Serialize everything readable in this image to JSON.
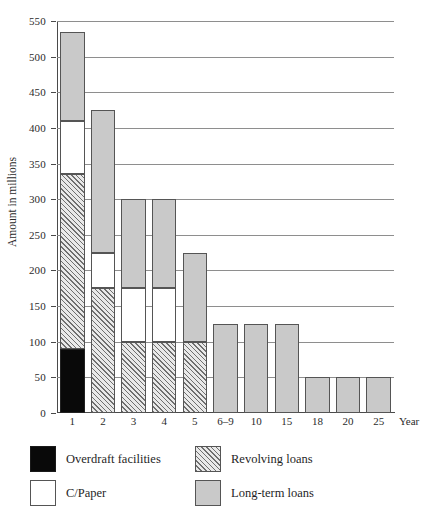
{
  "chart_data": {
    "type": "bar",
    "subtype": "stacked-vertical",
    "title": "",
    "xlabel": "Year",
    "ylabel": "Amount in millions",
    "categories": [
      "1",
      "2",
      "3",
      "4",
      "5",
      "6–9",
      "10",
      "15",
      "18",
      "20",
      "25"
    ],
    "series": [
      {
        "name": "Overdraft facilities",
        "color": "#090909",
        "pattern": "solid-black",
        "values": [
          90,
          0,
          0,
          0,
          0,
          0,
          0,
          0,
          0,
          0,
          0
        ]
      },
      {
        "name": "Revolving loans",
        "color": "#6f6f6f",
        "pattern": "diagonal-hatch",
        "values": [
          245,
          175,
          100,
          100,
          100,
          0,
          0,
          0,
          0,
          0,
          0
        ]
      },
      {
        "name": "C/Paper",
        "color": "#ffffff",
        "pattern": "solid-white",
        "values": [
          75,
          50,
          75,
          75,
          0,
          0,
          0,
          0,
          0,
          0,
          0
        ]
      },
      {
        "name": "Long-term loans",
        "color": "#c9c9c9",
        "pattern": "solid-gray",
        "values": [
          125,
          200,
          125,
          125,
          125,
          125,
          125,
          125,
          50,
          50,
          50
        ]
      }
    ],
    "totals": [
      535,
      425,
      300,
      300,
      225,
      125,
      125,
      125,
      50,
      50,
      50
    ],
    "ylim": [
      0,
      550
    ],
    "yticks": [
      0,
      50,
      100,
      150,
      200,
      250,
      300,
      350,
      400,
      450,
      500,
      550
    ],
    "ytick_labels": [
      "0",
      "50",
      "100",
      "150",
      "200",
      "250",
      "300",
      "350",
      "400",
      "450",
      "500",
      "550"
    ],
    "grid": "horizontal",
    "legend_position": "below-plot",
    "stack_order_bottom_to_top": [
      "Overdraft facilities",
      "Revolving loans",
      "C/Paper",
      "Long-term loans"
    ]
  },
  "axes": {
    "y_title": "Amount in millions",
    "x_title": "Year"
  },
  "legend": {
    "items": [
      {
        "label": "Overdraft facilities",
        "swatch": "overdraft"
      },
      {
        "label": "Revolving loans",
        "swatch": "revolving"
      },
      {
        "label": "C/Paper",
        "swatch": "cpaper"
      },
      {
        "label": "Long-term loans",
        "swatch": "longterm"
      }
    ]
  }
}
